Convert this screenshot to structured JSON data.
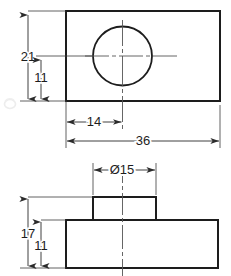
{
  "drawing": {
    "title": "Mechanical part orthographic drawing",
    "background_color": "#ffffff",
    "line_color": "#1d1d1d",
    "centerline_color": "#9a9a9a",
    "dimension_line_color": "#3a3a3a",
    "units_note": "",
    "views": [
      {
        "name": "top-view",
        "description": "Rectangular plate with centered through hole",
        "outline": {
          "shape": "rectangle",
          "x": 66,
          "y": 11,
          "width": 154,
          "height": 90
        },
        "hole": {
          "shape": "circle",
          "cx": 122.5,
          "cy": 56,
          "r": 29.5
        }
      },
      {
        "name": "front-view",
        "description": "Base block with raised boss",
        "base": {
          "shape": "rectangle",
          "x": 66,
          "y": 220,
          "width": 152,
          "height": 48
        },
        "boss": {
          "shape": "rectangle",
          "x": 93,
          "y": 197,
          "width": 63,
          "height": 23
        }
      }
    ],
    "dimensions": [
      {
        "id": "dim-21",
        "label": "21",
        "value": 21,
        "orientation": "vertical",
        "view": "top-view",
        "text_x": 28,
        "text_y": 61
      },
      {
        "id": "dim-11-top",
        "label": "11",
        "value": 11,
        "orientation": "vertical",
        "view": "top-view",
        "text_x": 41,
        "text_y": 82
      },
      {
        "id": "dim-14",
        "label": "14",
        "value": 14,
        "orientation": "horizontal",
        "view": "top-view",
        "text_x": 94,
        "text_y": 126
      },
      {
        "id": "dim-36",
        "label": "36",
        "value": 36,
        "orientation": "horizontal",
        "view": "top-view",
        "text_x": 143,
        "text_y": 145
      },
      {
        "id": "dim-diameter-15",
        "label": "Ø15",
        "value": 15,
        "symbol": "Ø",
        "orientation": "horizontal",
        "view": "front-view",
        "text_x": 122,
        "text_y": 174
      },
      {
        "id": "dim-17",
        "label": "17",
        "value": 17,
        "orientation": "vertical",
        "view": "front-view",
        "text_x": 28,
        "text_y": 238
      },
      {
        "id": "dim-11-front",
        "label": "11",
        "value": 11,
        "orientation": "vertical",
        "view": "front-view",
        "text_x": 41,
        "text_y": 250
      }
    ],
    "artifact": {
      "name": "faint-smudge",
      "x": 5,
      "y": 100,
      "color": "#e3e3e3"
    }
  }
}
